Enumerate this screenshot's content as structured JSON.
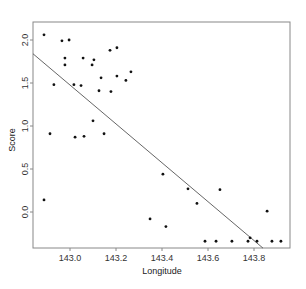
{
  "chart_data": {
    "type": "scatter",
    "title": "",
    "xlabel": "Longitude",
    "ylabel": "Score",
    "xlim": [
      142.84,
      143.95
    ],
    "ylim": [
      -0.42,
      2.16
    ],
    "grid": false,
    "legend": null,
    "x_ticks": [
      143.0,
      143.2,
      143.4,
      143.6,
      143.8
    ],
    "x_tick_labels": [
      "143.0",
      "143.2",
      "143.4",
      "143.6",
      "143.8"
    ],
    "y_ticks": [
      0.0,
      0.5,
      1.0,
      1.5,
      2.0
    ],
    "y_tick_labels": [
      "0.0",
      "0.5",
      "1.0",
      "1.5",
      "2.0"
    ],
    "series": [
      {
        "name": "observations",
        "marker": "dot",
        "color": "#111111",
        "points": [
          [
            142.887,
            2.06
          ],
          [
            142.965,
            1.99
          ],
          [
            142.996,
            2.0
          ],
          [
            142.978,
            1.79
          ],
          [
            142.978,
            1.71
          ],
          [
            143.057,
            1.79
          ],
          [
            143.104,
            1.77
          ],
          [
            143.096,
            1.71
          ],
          [
            143.174,
            1.88
          ],
          [
            143.204,
            1.91
          ],
          [
            143.135,
            1.56
          ],
          [
            143.204,
            1.58
          ],
          [
            143.243,
            1.53
          ],
          [
            143.265,
            1.63
          ],
          [
            142.93,
            1.48
          ],
          [
            143.017,
            1.48
          ],
          [
            143.048,
            1.47
          ],
          [
            143.126,
            1.41
          ],
          [
            143.178,
            1.4
          ],
          [
            142.913,
            0.91
          ],
          [
            143.022,
            0.87
          ],
          [
            143.061,
            0.88
          ],
          [
            143.1,
            1.06
          ],
          [
            143.148,
            0.91
          ],
          [
            142.887,
            0.14
          ],
          [
            143.348,
            -0.08
          ],
          [
            143.404,
            0.44
          ],
          [
            143.417,
            -0.17
          ],
          [
            143.513,
            0.27
          ],
          [
            143.552,
            0.1
          ],
          [
            143.652,
            0.26
          ],
          [
            143.587,
            -0.34
          ],
          [
            143.635,
            -0.34
          ],
          [
            143.704,
            -0.34
          ],
          [
            143.774,
            -0.34
          ],
          [
            143.783,
            -0.3
          ],
          [
            143.813,
            -0.34
          ],
          [
            143.857,
            0.01
          ],
          [
            143.878,
            -0.34
          ],
          [
            143.917,
            -0.34
          ]
        ]
      }
    ],
    "regression_line": {
      "name": "fitted line",
      "color": "#555555",
      "from": [
        142.839,
        1.84
      ],
      "to": [
        143.839,
        -0.42
      ]
    }
  }
}
